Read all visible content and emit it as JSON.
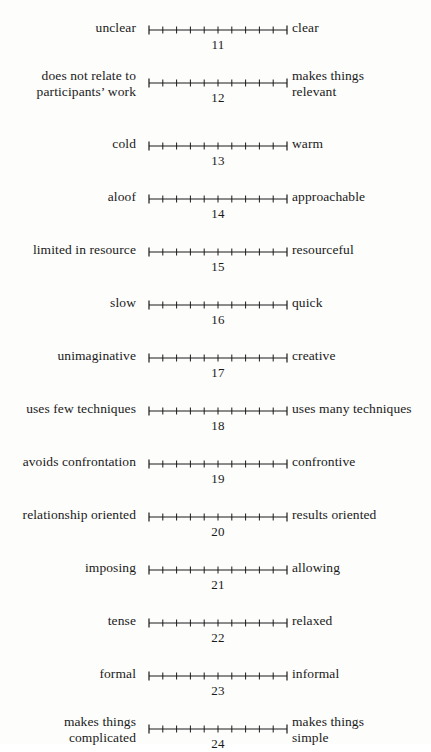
{
  "document": {
    "type": "semantic-differential-rating-scale",
    "background_color": "#fdfdfc",
    "ink_color": "#1a1a1a"
  },
  "scale": {
    "tick_count": 11,
    "segment_count": 10,
    "min_label": "",
    "max_label": ""
  },
  "items": [
    {
      "number": "11",
      "left": "unclear",
      "right": "clear",
      "left_lines": 1,
      "right_lines": 1
    },
    {
      "number": "12",
      "left": "does not relate to\nparticipants’ work",
      "right": "makes things\nrelevant",
      "left_lines": 2,
      "right_lines": 2
    },
    {
      "number": "13",
      "left": "cold",
      "right": "warm",
      "left_lines": 1,
      "right_lines": 1
    },
    {
      "number": "14",
      "left": "aloof",
      "right": "approachable",
      "left_lines": 1,
      "right_lines": 1
    },
    {
      "number": "15",
      "left": "limited in resource",
      "right": "resourceful",
      "left_lines": 1,
      "right_lines": 1
    },
    {
      "number": "16",
      "left": "slow",
      "right": "quick",
      "left_lines": 1,
      "right_lines": 1
    },
    {
      "number": "17",
      "left": "unimaginative",
      "right": "creative",
      "left_lines": 1,
      "right_lines": 1
    },
    {
      "number": "18",
      "left": "uses few techniques",
      "right": "uses many techniques",
      "left_lines": 1,
      "right_lines": 1
    },
    {
      "number": "19",
      "left": "avoids confrontation",
      "right": "confrontive",
      "left_lines": 1,
      "right_lines": 1
    },
    {
      "number": "20",
      "left": "relationship oriented",
      "right": "results oriented",
      "left_lines": 1,
      "right_lines": 1
    },
    {
      "number": "21",
      "left": "imposing",
      "right": "allowing",
      "left_lines": 1,
      "right_lines": 1
    },
    {
      "number": "22",
      "left": "tense",
      "right": "relaxed",
      "left_lines": 1,
      "right_lines": 1
    },
    {
      "number": "23",
      "left": "formal",
      "right": "informal",
      "left_lines": 1,
      "right_lines": 1
    },
    {
      "number": "24",
      "left": "makes things\ncomplicated",
      "right": "makes things\nsimple",
      "left_lines": 2,
      "right_lines": 2
    }
  ]
}
